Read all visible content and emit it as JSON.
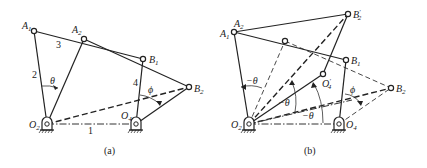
{
  "figure": {
    "panels": [
      {
        "id": "a",
        "caption": "(a)",
        "labels": {
          "A1": "A",
          "A1_sub": "1",
          "A2": "A",
          "A2_sub": "2",
          "B1": "B",
          "B1_sub": "1",
          "B2": "B",
          "B2_sub": "2",
          "O2": "O",
          "O2_sub": "2",
          "O4": "O",
          "O4_sub": "4",
          "link1": "1",
          "link2": "2",
          "link3": "3",
          "link4": "4",
          "theta": "θ",
          "phi": "ϕ"
        }
      },
      {
        "id": "b",
        "caption": "(b)",
        "labels": {
          "A1": "A",
          "A1_sub": "1",
          "A2": "A",
          "A2_sub": "2",
          "B1": "B",
          "B1_sub": "1",
          "B2": "B",
          "B2_sub": "2",
          "B2p": "B",
          "B2p_sub": "2",
          "B2p_prime": "′",
          "O2": "O",
          "O2_sub": "2",
          "O4": "O",
          "O4_sub": "4",
          "O4p": "O",
          "O4p_sub": "4",
          "O4p_prime": "′",
          "neg_theta_1": "−θ",
          "neg_theta_2": "−θ",
          "neg_theta_3": "−θ",
          "phi": "ϕ"
        }
      }
    ]
  }
}
